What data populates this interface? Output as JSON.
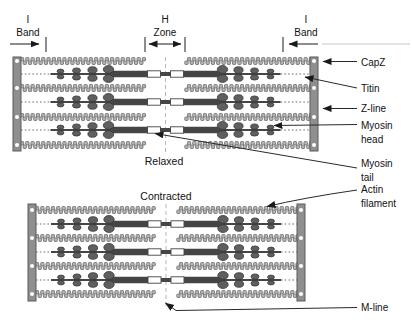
{
  "figure": {
    "title_meaning": "Sarcomere structure, relaxed vs contracted",
    "top_annotations": {
      "i_band_left": {
        "line1": "I",
        "line2": "Band"
      },
      "h_zone": {
        "line1": "H",
        "line2": "Zone"
      },
      "i_band_right": {
        "line1": "I",
        "line2": "Band"
      }
    },
    "states": {
      "relaxed_caption": "Relaxed",
      "contracted_caption": "Contracted"
    },
    "side_labels": {
      "capz": {
        "line1": "CapZ"
      },
      "titin": {
        "line1": "Titin"
      },
      "z_line": {
        "line1": "Z-line"
      },
      "myosin_head": {
        "line1": "Myosin",
        "line2": "head"
      },
      "myosin_tail": {
        "line1": "Myosin",
        "line2": "tail"
      },
      "actin_filament": {
        "line1": "Actin",
        "line2": "filament"
      },
      "m_line": {
        "line1": "M-line"
      }
    },
    "colors": {
      "background": "#ffffff",
      "z_line": "#8f8f8f",
      "z_line_edge": "#5a5a5a",
      "capz_dot": "#ffffff",
      "actin": "#b4b4b4",
      "actin_outline": "#707070",
      "myosin": "#454545",
      "myosin_bare_zone": "#ffffff",
      "myosin_head": "#5f5f5f",
      "myosin_head_edge": "#383838",
      "titin": "#9e9e9e",
      "m_line": "#b8b8b8",
      "annotation": "#1a1a1a"
    }
  }
}
